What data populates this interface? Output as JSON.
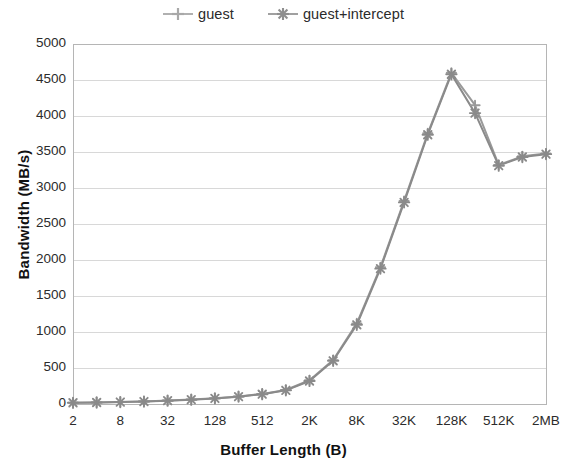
{
  "chart_data": {
    "type": "line",
    "title": "",
    "xlabel": "Buffer Length (B)",
    "ylabel": "Bandwidth (MB/s)",
    "ylim": [
      0,
      5000
    ],
    "ytick_labels": [
      "0",
      "500",
      "1000",
      "1500",
      "2000",
      "2500",
      "3000",
      "3500",
      "4000",
      "4500",
      "5000"
    ],
    "ytick_values": [
      0,
      500,
      1000,
      1500,
      2000,
      2500,
      3000,
      3500,
      4000,
      4500,
      5000
    ],
    "grid": true,
    "grid_axis": "y",
    "legend_position": "top-center",
    "categories": [
      "2",
      "4",
      "8",
      "16",
      "32",
      "64",
      "128",
      "256",
      "512",
      "1K",
      "2K",
      "4K",
      "8K",
      "16K",
      "32K",
      "64K",
      "128K",
      "256K",
      "512K",
      "1MB",
      "2MB"
    ],
    "xtick_labels": [
      "2",
      "8",
      "32",
      "128",
      "512",
      "2K",
      "8K",
      "32K",
      "128K",
      "512K",
      "2MB"
    ],
    "xtick_indices": [
      0,
      2,
      4,
      6,
      8,
      10,
      12,
      14,
      16,
      18,
      20
    ],
    "series": [
      {
        "name": "guest",
        "marker": "plus",
        "color": "#9a9a9a",
        "values": [
          18,
          22,
          28,
          36,
          48,
          62,
          80,
          105,
          140,
          195,
          330,
          610,
          1120,
          1900,
          2820,
          3760,
          4600,
          4150,
          3320,
          3440,
          3480
        ]
      },
      {
        "name": "guest+intercept",
        "marker": "asterisk",
        "color": "#8a8a8a",
        "values": [
          17,
          21,
          27,
          34,
          46,
          60,
          78,
          102,
          136,
          190,
          320,
          600,
          1100,
          1880,
          2800,
          3740,
          4580,
          4040,
          3310,
          3430,
          3470
        ]
      }
    ]
  },
  "legend": {
    "items": [
      {
        "label": "guest",
        "marker": "plus-marker-icon"
      },
      {
        "label": "guest+intercept",
        "marker": "asterisk-marker-icon"
      }
    ]
  },
  "colors": {
    "series_guest": "#9a9a9a",
    "series_guest_intercept": "#8a8a8a",
    "grid": "#d8d8d8",
    "axis": "#b5b5b5",
    "text": "#2b2b2b"
  }
}
